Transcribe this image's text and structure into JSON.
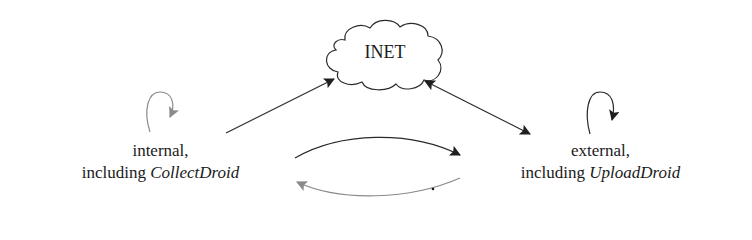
{
  "diagram": {
    "nodes": {
      "inet": {
        "label": "INET",
        "shape": "cloud"
      },
      "internal": {
        "line1": "internal,",
        "line2_prefix": "including ",
        "line2_italic": "CollectDroid"
      },
      "external": {
        "line1": "external,",
        "line2_prefix": "including ",
        "line2_italic": "UploadDroid"
      }
    },
    "edges": [
      {
        "from": "internal",
        "to": "inet",
        "style": "solid",
        "color": "#2a2a2a",
        "direction": "forward"
      },
      {
        "from": "inet",
        "to": "external",
        "style": "solid",
        "color": "#2a2a2a",
        "direction": "both"
      },
      {
        "from": "internal",
        "to": "external",
        "style": "curved",
        "color": "#2a2a2a",
        "direction": "forward"
      },
      {
        "from": "external",
        "to": "internal",
        "style": "curved",
        "color": "#8a8a8a",
        "direction": "forward"
      },
      {
        "from": "internal",
        "to": "internal",
        "style": "self-loop",
        "color": "#8a8a8a"
      },
      {
        "from": "external",
        "to": "external",
        "style": "self-loop",
        "color": "#2a2a2a"
      }
    ],
    "colors": {
      "dark": "#2a2a2a",
      "gray": "#8a8a8a"
    }
  }
}
